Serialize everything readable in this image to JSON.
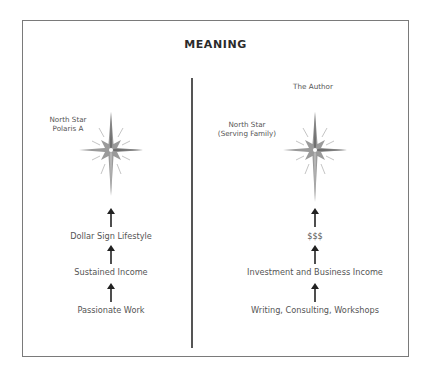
{
  "title": "MEANING",
  "left": {
    "star_label_line1": "North Star",
    "star_label_line2": "Polaris A",
    "steps": [
      "Dollar Sign Lifestyle",
      "Sustained Income",
      "Passionate Work"
    ]
  },
  "right": {
    "header": "The Author",
    "star_label_line1": "North Star",
    "star_label_line2": "(Serving Family)",
    "steps": [
      "$$$",
      "Investment and Business Income",
      "Writing, Consulting, Workshops"
    ]
  },
  "icons": {
    "star": "north-star-icon",
    "arrow": "arrow-up-icon"
  },
  "colors": {
    "text": "#555555",
    "title": "#2b2b2b",
    "border": "#7a7a7a",
    "star": "#8a8a8a"
  }
}
